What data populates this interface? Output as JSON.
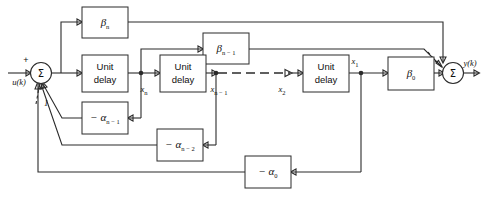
{
  "figure": {
    "kind": "control-block-diagram",
    "line_color": "#2b2b2b",
    "background": "#ffffff"
  },
  "signals": {
    "input": "u(k)",
    "input_sign": "+",
    "output": "y(k)",
    "tap_xn": "x",
    "tap_xn_sub": "n",
    "tap_xn1": "x",
    "tap_xn1_sub": "n − 1",
    "tap_x2": "x",
    "tap_x2_sub": "2",
    "tap_x1": "x",
    "tap_x1_sub": "1",
    "continuation_marker": "1"
  },
  "blocks": {
    "beta_n": {
      "label": "β",
      "sub": "n",
      "name": "beta-n-gain"
    },
    "beta_n_minus_1": {
      "label": "β",
      "sub": "n − 1",
      "name": "beta-n-minus-1-gain"
    },
    "beta_0": {
      "label": "β",
      "sub": "0",
      "name": "beta-0-gain"
    },
    "alpha_n_minus_1": {
      "label": "− α",
      "sub": "n − 1",
      "name": "alpha-n-minus-1-gain"
    },
    "alpha_n_minus_2": {
      "label": "− α",
      "sub": "n − 2",
      "name": "alpha-n-minus-2-gain"
    },
    "alpha_0": {
      "label": "− α",
      "sub": "0",
      "name": "alpha-0-gain"
    },
    "delay_1": {
      "line1": "Unit",
      "line2": "delay",
      "name": "unit-delay-1"
    },
    "delay_2": {
      "line1": "Unit",
      "line2": "delay",
      "name": "unit-delay-2"
    },
    "delay_3": {
      "line1": "Unit",
      "line2": "delay",
      "name": "unit-delay-3"
    }
  },
  "junctions": {
    "input_summer": {
      "glyph": "Σ",
      "name": "input-summing-junction"
    },
    "output_summer": {
      "glyph": "Σ",
      "name": "output-summing-junction"
    }
  }
}
